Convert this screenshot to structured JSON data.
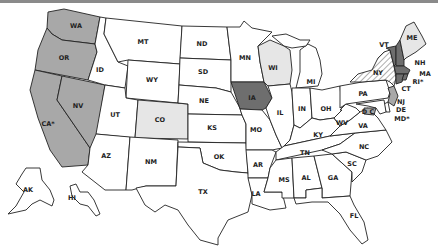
{
  "map": {
    "title": "United States map",
    "colors": {
      "dark": "#6e6e6e",
      "medium": "#a8a8a8",
      "light": "#e6e6e6",
      "none": "#ffffff",
      "hatched": "#ffffff"
    },
    "states": {
      "WA": {
        "label": "WA",
        "fill": "medium"
      },
      "OR": {
        "label": "OR",
        "fill": "medium"
      },
      "CA": {
        "label": "CA*",
        "fill": "medium"
      },
      "NV": {
        "label": "NV",
        "fill": "medium"
      },
      "ID": {
        "label": "ID",
        "fill": "none"
      },
      "MT": {
        "label": "MT",
        "fill": "none"
      },
      "WY": {
        "label": "WY",
        "fill": "none"
      },
      "UT": {
        "label": "UT",
        "fill": "none"
      },
      "CO": {
        "label": "CO",
        "fill": "light"
      },
      "AZ": {
        "label": "AZ",
        "fill": "none"
      },
      "NM": {
        "label": "NM",
        "fill": "none"
      },
      "ND": {
        "label": "ND",
        "fill": "none"
      },
      "SD": {
        "label": "SD",
        "fill": "none"
      },
      "NE": {
        "label": "NE",
        "fill": "none"
      },
      "KS": {
        "label": "KS",
        "fill": "none"
      },
      "OK": {
        "label": "OK",
        "fill": "none"
      },
      "TX": {
        "label": "TX",
        "fill": "none"
      },
      "MN": {
        "label": "MN",
        "fill": "none"
      },
      "IA": {
        "label": "IA",
        "fill": "dark"
      },
      "MO": {
        "label": "MO",
        "fill": "none"
      },
      "AR": {
        "label": "AR",
        "fill": "none"
      },
      "LA": {
        "label": "LA",
        "fill": "none"
      },
      "WI": {
        "label": "WI",
        "fill": "light"
      },
      "IL": {
        "label": "IL",
        "fill": "none"
      },
      "MI": {
        "label": "MI",
        "fill": "none"
      },
      "IN": {
        "label": "IN",
        "fill": "none"
      },
      "OH": {
        "label": "OH",
        "fill": "none"
      },
      "KY": {
        "label": "KY",
        "fill": "none"
      },
      "TN": {
        "label": "TN",
        "fill": "none"
      },
      "MS": {
        "label": "MS",
        "fill": "none"
      },
      "AL": {
        "label": "AL",
        "fill": "none"
      },
      "GA": {
        "label": "GA",
        "fill": "none"
      },
      "FL": {
        "label": "FL",
        "fill": "none"
      },
      "SC": {
        "label": "SC",
        "fill": "none"
      },
      "NC": {
        "label": "NC",
        "fill": "none"
      },
      "VA": {
        "label": "VA",
        "fill": "none"
      },
      "WV": {
        "label": "WV",
        "fill": "none"
      },
      "PA": {
        "label": "PA",
        "fill": "none"
      },
      "NY": {
        "label": "NY",
        "fill": "hatched"
      },
      "VT": {
        "label": "VT",
        "fill": "dark"
      },
      "NH": {
        "label": "NH",
        "fill": "dark"
      },
      "ME": {
        "label": "ME",
        "fill": "light"
      },
      "MA": {
        "label": "MA",
        "fill": "dark"
      },
      "RI": {
        "label": "RI*",
        "fill": "dark"
      },
      "CT": {
        "label": "CT",
        "fill": "dark"
      },
      "NJ": {
        "label": "NJ",
        "fill": "medium"
      },
      "DE": {
        "label": "DE",
        "fill": "medium"
      },
      "MD": {
        "label": "MD*",
        "fill": "medium"
      },
      "DC": {
        "label": "D C",
        "fill": "medium"
      },
      "AK": {
        "label": "AK",
        "fill": "none"
      },
      "HI": {
        "label": "HI",
        "fill": "none"
      }
    }
  }
}
